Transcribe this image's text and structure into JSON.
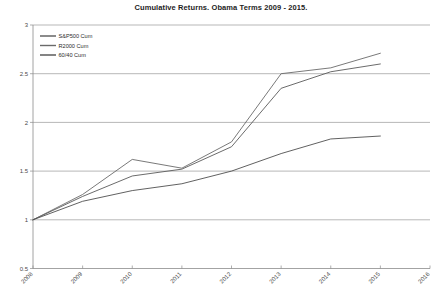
{
  "chart_data": {
    "type": "line",
    "title": "Cumulative Returns. Obama Terms 2009 - 2015.",
    "xlabel": "",
    "ylabel": "",
    "x": [
      "2008",
      "2009",
      "2010",
      "2011",
      "2012",
      "2013",
      "2014",
      "2015"
    ],
    "xticks": [
      "2008",
      "2009",
      "2010",
      "2011",
      "2012",
      "2013",
      "2014",
      "2015",
      "2016"
    ],
    "yticks": [
      "0.5",
      "1",
      "1.5",
      "2",
      "2.5",
      "3"
    ],
    "ylim": [
      0.5,
      3
    ],
    "xlim": [
      "2008",
      "2016"
    ],
    "grid": true,
    "legend_position": "top-left",
    "series": [
      {
        "name": "S&P500 Cum",
        "color": "#5a5a5a",
        "values": [
          1.0,
          1.24,
          1.45,
          1.52,
          1.75,
          2.35,
          2.52,
          2.6
        ]
      },
      {
        "name": "R2000 Cum",
        "color": "#6a6a6a",
        "values": [
          1.0,
          1.26,
          1.62,
          1.53,
          1.8,
          2.5,
          2.56,
          2.71
        ]
      },
      {
        "name": "60/40 Cum",
        "color": "#4f4f4f",
        "values": [
          1.0,
          1.19,
          1.3,
          1.37,
          1.5,
          1.68,
          1.83,
          1.86
        ]
      }
    ]
  },
  "legend": {
    "items": [
      {
        "label": "S&P500 Cum"
      },
      {
        "label": "R2000 Cum"
      },
      {
        "label": "60/40 Cum"
      }
    ]
  }
}
